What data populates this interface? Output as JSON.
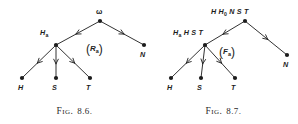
{
  "figures": [
    {
      "id": "fig-8-6",
      "caption_word": "Fig.",
      "caption_number": "8.6.",
      "edge_tag": {
        "open": "(",
        "symbol": "R",
        "subscript": "a",
        "close": ")"
      },
      "nodes": [
        {
          "name": "root",
          "label": "ω",
          "sub": "",
          "x": 100,
          "y": 21,
          "label_x": 96,
          "label_y": 8,
          "style": "omega"
        },
        {
          "name": "left",
          "label": "H",
          "sub": "a",
          "x": 56,
          "y": 45,
          "label_x": 40,
          "label_y": 29,
          "style": "italic"
        },
        {
          "name": "right",
          "label": "N",
          "sub": "",
          "x": 144,
          "y": 45,
          "label_x": 140,
          "label_y": 51,
          "style": "italic"
        },
        {
          "name": "leaf-h",
          "label": "H",
          "sub": "",
          "x": 22,
          "y": 78,
          "label_x": 18,
          "label_y": 84,
          "style": "italic"
        },
        {
          "name": "leaf-s",
          "label": "S",
          "sub": "",
          "x": 56,
          "y": 78,
          "label_x": 52,
          "label_y": 84,
          "style": "italic"
        },
        {
          "name": "leaf-t",
          "label": "T",
          "sub": "",
          "x": 90,
          "y": 78,
          "label_x": 86,
          "label_y": 84,
          "style": "italic"
        }
      ],
      "edges": [
        {
          "name": "root-to-left",
          "x1": 100,
          "y1": 21,
          "x2": 56,
          "y2": 45
        },
        {
          "name": "root-to-right",
          "x1": 100,
          "y1": 21,
          "x2": 144,
          "y2": 45
        },
        {
          "name": "left-to-h",
          "x1": 56,
          "y1": 45,
          "x2": 22,
          "y2": 78
        },
        {
          "name": "left-to-s",
          "x1": 56,
          "y1": 45,
          "x2": 56,
          "y2": 78
        },
        {
          "name": "left-to-t",
          "x1": 56,
          "y1": 45,
          "x2": 90,
          "y2": 78
        }
      ]
    },
    {
      "id": "fig-8-7",
      "caption_word": "Fig.",
      "caption_number": "8.7.",
      "edge_tag": {
        "open": "(",
        "symbol": "F",
        "subscript": "a",
        "close": ")"
      },
      "nodes": [
        {
          "name": "root",
          "label": "H H",
          "sub": "0",
          "label_suffix": " N S T",
          "x": 96,
          "y": 21,
          "label_x": 62,
          "label_y": 8,
          "style": "italic"
        },
        {
          "name": "left",
          "label": "H",
          "sub": "a",
          "label_suffix": " H S T",
          "x": 56,
          "y": 45,
          "label_x": 24,
          "label_y": 29,
          "style": "italic"
        },
        {
          "name": "right",
          "label": "N",
          "sub": "",
          "x": 138,
          "y": 55,
          "label_x": 134,
          "label_y": 61,
          "style": "italic"
        },
        {
          "name": "leaf-h",
          "label": "H",
          "sub": "",
          "x": 22,
          "y": 78,
          "label_x": 18,
          "label_y": 84,
          "style": "italic"
        },
        {
          "name": "leaf-s",
          "label": "S",
          "sub": "",
          "x": 52,
          "y": 78,
          "label_x": 48,
          "label_y": 84,
          "style": "italic"
        },
        {
          "name": "leaf-t",
          "label": "T",
          "sub": "",
          "x": 86,
          "y": 78,
          "label_x": 82,
          "label_y": 84,
          "style": "italic"
        }
      ],
      "edges": [
        {
          "name": "root-to-left",
          "x1": 96,
          "y1": 21,
          "x2": 56,
          "y2": 45
        },
        {
          "name": "root-to-right",
          "x1": 96,
          "y1": 21,
          "x2": 138,
          "y2": 55
        },
        {
          "name": "left-to-h",
          "x1": 56,
          "y1": 45,
          "x2": 22,
          "y2": 78
        },
        {
          "name": "left-to-s",
          "x1": 56,
          "y1": 45,
          "x2": 52,
          "y2": 78
        },
        {
          "name": "left-to-t",
          "x1": 56,
          "y1": 45,
          "x2": 86,
          "y2": 78
        }
      ]
    }
  ],
  "style": {
    "ink": "#1c1c1c",
    "node_radius": 2.1,
    "edge_width": 0.9
  }
}
